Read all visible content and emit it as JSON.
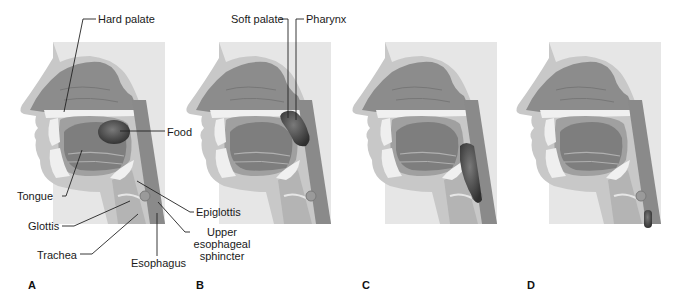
{
  "figure": {
    "panels": [
      {
        "letter": "A",
        "food_stage": "food in oral cavity"
      },
      {
        "letter": "B",
        "food_stage": "food pushed against soft palate into pharynx"
      },
      {
        "letter": "C",
        "food_stage": "food in pharynx, epiglottis closes"
      },
      {
        "letter": "D",
        "food_stage": "food enters esophagus"
      }
    ],
    "labels": {
      "hard_palate": "Hard palate",
      "food": "Food",
      "tongue": "Tongue",
      "glottis": "Glottis",
      "trachea": "Trachea",
      "esophagus": "Esophagus",
      "epiglottis": "Epiglottis",
      "upper_sphincter_1": "Upper",
      "upper_sphincter_2": "esophageal",
      "upper_sphincter_3": "sphincter",
      "soft_palate": "Soft palate",
      "pharynx": "Pharynx"
    },
    "colors": {
      "background_panel": "#e6e6e6",
      "tissue_light": "#c4c4c4",
      "tissue_mid": "#9a9a9a",
      "cavity_dark": "#808080",
      "bone_white": "#f0f0f0",
      "food_bolus": "#3d3d3d",
      "leader_line": "#222222"
    }
  }
}
